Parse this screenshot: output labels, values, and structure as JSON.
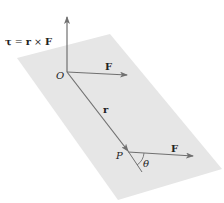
{
  "diagram": {
    "torque_label": {
      "tau": "τ",
      "equals": " = ",
      "r": "r",
      "times": " × ",
      "F": "F"
    },
    "origin_label": "O",
    "point_label": "P",
    "position_vector_label": "r",
    "force_at_origin_label": "F",
    "force_at_point_label": "F",
    "angle_label": "θ",
    "colors": {
      "plane": "#e6e6e6",
      "vector": "#707070",
      "text": "#222222",
      "background": "#ffffff"
    }
  }
}
